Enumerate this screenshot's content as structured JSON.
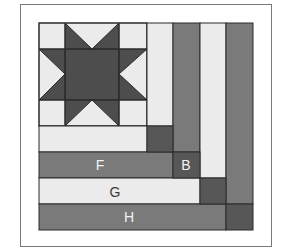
{
  "figure": {
    "colors": {
      "light": "#ebebeb",
      "medium": "#7a7a7a",
      "dark": "#575757",
      "star": "#4d4d4d",
      "outline": "#2a2a2a",
      "frame": "#7a7a7a"
    },
    "labels": {
      "F": "F",
      "B": "B",
      "G": "G",
      "H": "H"
    }
  }
}
